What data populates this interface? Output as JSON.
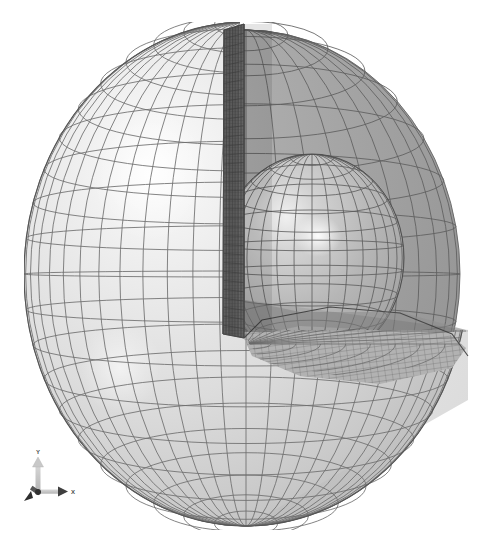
{
  "view": {
    "background_color": "#ffffff",
    "title": "Cutaway meshed sphere with inner core",
    "width": 492,
    "height": 552
  },
  "model": {
    "name": "sectioned-sphere-mesh",
    "description": "Quarter-wedge cutaway of a finite-element meshed sphere revealing an inner spherical core",
    "center_x": 246,
    "center_y": 274,
    "radius_x": 222,
    "radius_y": 252,
    "inner_core_center_x": 312,
    "inner_core_center_y": 258,
    "inner_core_radius_x": 92,
    "inner_core_radius_y": 104,
    "cut_plane_x": 240,
    "cut_floor_y": 330
  },
  "colors": {
    "outer_surface_light": "#ededed",
    "outer_surface_mid": "#dcdcdc",
    "outer_surface_shade": "#c4c4c4",
    "cavity_surface": "#a8a8a8",
    "cavity_surface_dark": "#9a9a9a",
    "cut_face_dark": "#5f5f5f",
    "cut_face_mid": "#777777",
    "floor_plane": "#b4b4b4",
    "core_surface": "#b8b8b8",
    "core_highlight": "#f2f2f2",
    "wireframe_line": "#6b6b6b",
    "wireframe_line_light": "#8f8f8f",
    "outline": "#555555",
    "axis_shaft_light": "#c9c9c9",
    "axis_shaft_dark": "#3a3a3a",
    "axis_text": "#4a4a4a",
    "specular_highlight": "#ffffff"
  },
  "mesh": {
    "outer_meridians": 26,
    "outer_parallels": 22,
    "cavity_meridians": 20,
    "cavity_parallels": 16,
    "cut_face_rows": 34,
    "cut_face_cols": 7,
    "floor_rings": 9,
    "floor_spokes": 22,
    "line_width": 0.8
  },
  "highlights": [
    {
      "name": "outer-specular",
      "cx": 150,
      "cy": 175,
      "rx": 58,
      "ry": 66
    },
    {
      "name": "outer-lower-specular",
      "cx": 120,
      "cy": 365,
      "rx": 40,
      "ry": 44
    },
    {
      "name": "core-specular",
      "cx": 318,
      "cy": 235,
      "rx": 22,
      "ry": 20
    }
  ],
  "axis_triad": {
    "name": "coordinate-axis-triad",
    "origin_x": 20,
    "origin_y": 44,
    "axes": [
      {
        "id": "y",
        "label": "Y",
        "direction": "up",
        "label_x": 20,
        "label_y": 5,
        "tip_x": 20,
        "tip_y": 14
      },
      {
        "id": "x",
        "label": "X",
        "direction": "right",
        "label_x": 55,
        "label_y": 47,
        "tip_x": 48,
        "tip_y": 44
      },
      {
        "id": "z",
        "label": "",
        "direction": "down-left",
        "label_x": 4,
        "label_y": 56,
        "tip_x": 8,
        "tip_y": 52
      }
    ]
  }
}
